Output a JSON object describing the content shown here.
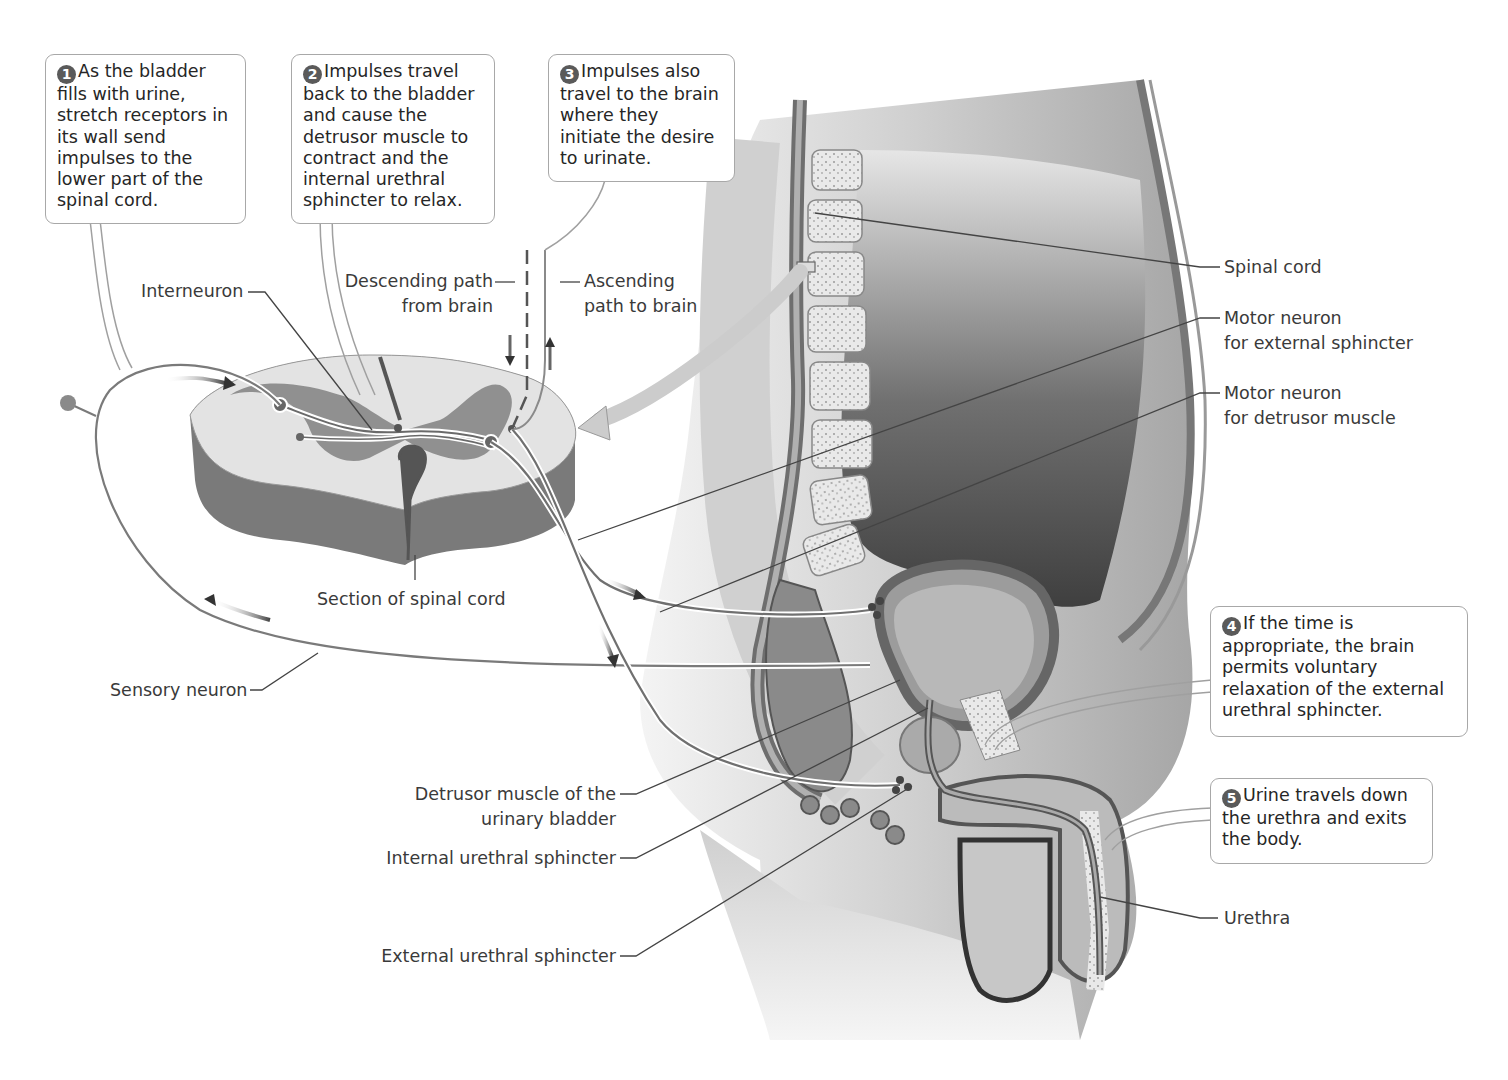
{
  "diagram": {
    "colors": {
      "background": "#ffffff",
      "callout_border": "#a8a8a8",
      "badge_fill": "#5a5a5a",
      "text": "#262626",
      "grey_matter": "#8c8c8c",
      "white_matter": "#dedede",
      "body_shading": "#b5b5b5",
      "leader_line": "#444444"
    }
  },
  "callouts": [
    {
      "number": "1",
      "text": "As the bladder fills with urine, stretch receptors in its wall send impulses to the lower part of the spinal cord."
    },
    {
      "number": "2",
      "text": "Impulses travel back to the bladder and cause the detrusor muscle to contract and the internal urethral sphincter to relax."
    },
    {
      "number": "3",
      "text": "Impulses also travel to the brain where they initiate the desire to urinate."
    },
    {
      "number": "4",
      "text": "If the time is appropriate, the brain permits voluntary relaxation of the external urethral sphincter."
    },
    {
      "number": "5",
      "text": "Urine travels down the urethra and exits the body."
    }
  ],
  "labels": {
    "interneuron": "Interneuron",
    "descending_path": [
      "Descending path",
      "from brain"
    ],
    "ascending_path": [
      "Ascending",
      "path to brain"
    ],
    "section_spinal_cord": "Section of spinal cord",
    "sensory_neuron": "Sensory neuron",
    "spinal_cord": "Spinal cord",
    "motor_external": [
      "Motor neuron",
      "for external sphincter"
    ],
    "motor_detrusor": [
      "Motor neuron",
      "for detrusor muscle"
    ],
    "detrusor_muscle": [
      "Detrusor muscle of the",
      "urinary bladder"
    ],
    "internal_sphincter": "Internal urethral sphincter",
    "external_sphincter": "External urethral sphincter",
    "urethra": "Urethra"
  },
  "icons": {
    "badge": "numbered-circle",
    "impulse_arrow": "direction-arrow",
    "magnify_arrow": "block-arrow"
  }
}
